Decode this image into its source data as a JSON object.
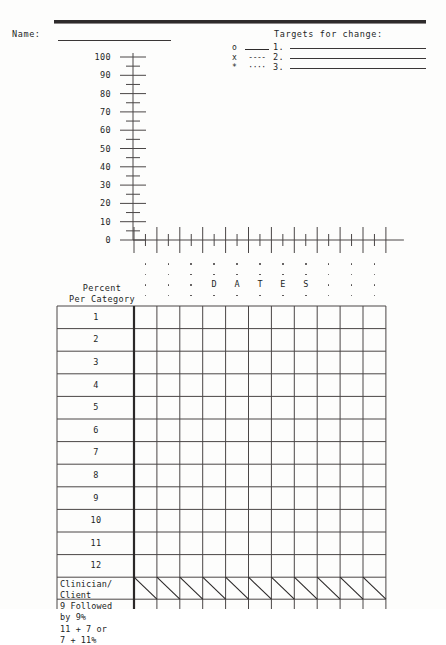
{
  "form": {
    "name_label": "Name:",
    "targets_title": "Targets for change:",
    "legend": [
      {
        "symbol": "o",
        "line_style": "solid",
        "dash_text": "",
        "number": "1."
      },
      {
        "symbol": "x",
        "line_style": "dashed",
        "dash_text": "----",
        "number": "2."
      },
      {
        "symbol": "*",
        "line_style": "dotted",
        "dash_text": "····",
        "number": "3."
      }
    ]
  },
  "chart_data": {
    "type": "line",
    "title": "",
    "xlabel": "DATES",
    "ylabel": "Percent Per Category",
    "ylim": [
      0,
      100
    ],
    "ytick_labels": [
      "100",
      "90",
      "80",
      "70",
      "60",
      "50",
      "40",
      "30",
      "20",
      "10",
      "0"
    ],
    "ytick_values": [
      100,
      90,
      80,
      70,
      60,
      50,
      40,
      30,
      20,
      10,
      0
    ],
    "minor_tick_step": 5,
    "grid": false,
    "legend_position": "top-right",
    "x_columns": 11,
    "series": [
      {
        "name": "1.",
        "marker": "o",
        "line_style": "solid",
        "values": []
      },
      {
        "name": "2.",
        "marker": "x",
        "line_style": "dashed",
        "values": []
      },
      {
        "name": "3.",
        "marker": "*",
        "line_style": "dotted",
        "values": []
      }
    ],
    "xlabel_letters": [
      "D",
      "A",
      "T",
      "E",
      "S"
    ],
    "note": "blank data-collection worksheet - no plotted data points"
  },
  "table": {
    "header": "Percent\nPer Category",
    "header_line1": "Percent",
    "header_line2": "Per Category",
    "column_count": 11,
    "column_headers": [
      "",
      "",
      "",
      "",
      "",
      "",
      "",
      "",
      "",
      "",
      ""
    ],
    "rows": [
      {
        "label": "1",
        "cells": [
          "",
          "",
          "",
          "",
          "",
          "",
          "",
          "",
          "",
          "",
          ""
        ]
      },
      {
        "label": "2",
        "cells": [
          "",
          "",
          "",
          "",
          "",
          "",
          "",
          "",
          "",
          "",
          ""
        ]
      },
      {
        "label": "3",
        "cells": [
          "",
          "",
          "",
          "",
          "",
          "",
          "",
          "",
          "",
          "",
          ""
        ]
      },
      {
        "label": "4",
        "cells": [
          "",
          "",
          "",
          "",
          "",
          "",
          "",
          "",
          "",
          "",
          ""
        ]
      },
      {
        "label": "5",
        "cells": [
          "",
          "",
          "",
          "",
          "",
          "",
          "",
          "",
          "",
          "",
          ""
        ]
      },
      {
        "label": "6",
        "cells": [
          "",
          "",
          "",
          "",
          "",
          "",
          "",
          "",
          "",
          "",
          ""
        ]
      },
      {
        "label": "7",
        "cells": [
          "",
          "",
          "",
          "",
          "",
          "",
          "",
          "",
          "",
          "",
          ""
        ]
      },
      {
        "label": "8",
        "cells": [
          "",
          "",
          "",
          "",
          "",
          "",
          "",
          "",
          "",
          "",
          ""
        ]
      },
      {
        "label": "9",
        "cells": [
          "",
          "",
          "",
          "",
          "",
          "",
          "",
          "",
          "",
          "",
          ""
        ]
      },
      {
        "label": "10",
        "cells": [
          "",
          "",
          "",
          "",
          "",
          "",
          "",
          "",
          "",
          "",
          ""
        ]
      },
      {
        "label": "11",
        "cells": [
          "",
          "",
          "",
          "",
          "",
          "",
          "",
          "",
          "",
          "",
          ""
        ]
      },
      {
        "label": "12",
        "cells": [
          "",
          "",
          "",
          "",
          "",
          "",
          "",
          "",
          "",
          "",
          ""
        ]
      }
    ],
    "summary_rows": [
      {
        "label_line1": "Clinician/",
        "label_line2": "Client",
        "style": "split-diagonal"
      },
      {
        "label_line1": "9 Followed",
        "label_line2": "by 9%",
        "style": "plain"
      },
      {
        "label_line1": "11 + 7 or",
        "label_line2": "7 + 11%",
        "style": "plain"
      }
    ]
  },
  "colors": {
    "ink": "#231f1f",
    "rule": "#2e2b2b",
    "grid_line": "#4a4646",
    "paper": "#fdfdfc"
  }
}
